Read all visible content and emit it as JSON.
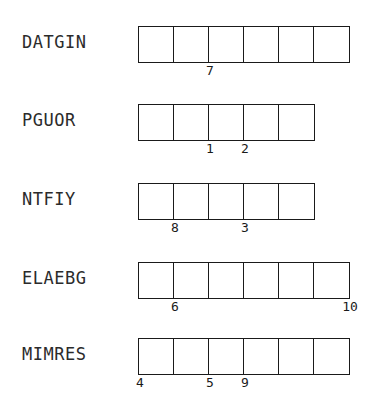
{
  "page": {
    "background_color": "#ffffff",
    "line_color": "#1a1a1a",
    "text_color": "#2b2b2b",
    "cell_size_px": 35,
    "grid_left_px": 138
  },
  "chart_data": {
    "type": "table",
    "title": "",
    "xlabel": "",
    "ylabel": "",
    "categories": [
      "DATGIN",
      "PGUOR",
      "NTFIY",
      "ELAEBG",
      "MIMRES"
    ],
    "values": [
      6,
      5,
      5,
      6,
      6
    ],
    "series": [
      {
        "name": "cell_count",
        "values": [
          6,
          5,
          5,
          6,
          6
        ]
      },
      {
        "name": "mark_count",
        "values": [
          1,
          2,
          2,
          2,
          3
        ]
      }
    ]
  },
  "rows": [
    {
      "label": "DATGIN",
      "cells": 6,
      "marks": [
        {
          "text": "7",
          "boundary": 2
        }
      ]
    },
    {
      "label": "PGUOR",
      "cells": 5,
      "marks": [
        {
          "text": "1",
          "boundary": 2
        },
        {
          "text": "2",
          "boundary": 3
        }
      ]
    },
    {
      "label": "NTFIY",
      "cells": 5,
      "marks": [
        {
          "text": "8",
          "boundary": 1
        },
        {
          "text": "3",
          "boundary": 3
        }
      ]
    },
    {
      "label": "ELAEBG",
      "cells": 6,
      "marks": [
        {
          "text": "6",
          "boundary": 1
        },
        {
          "text": "10",
          "boundary": 6
        }
      ]
    },
    {
      "label": "MIMRES",
      "cells": 6,
      "marks": [
        {
          "text": "4",
          "boundary": 0
        },
        {
          "text": "5",
          "boundary": 2
        },
        {
          "text": "9",
          "boundary": 3
        }
      ]
    }
  ]
}
